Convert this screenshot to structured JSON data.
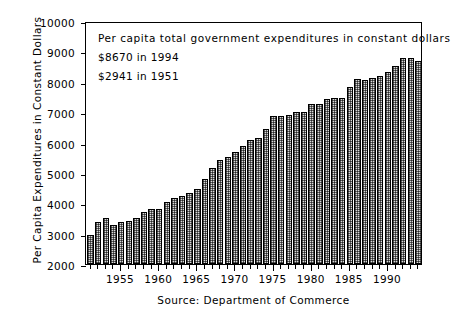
{
  "chart_data": {
    "type": "bar",
    "title": "",
    "xlabel": "",
    "ylabel": "Per Capita Expenditures in Constant Dollars",
    "ylim": [
      2000,
      10000
    ],
    "ytick_step": 1000,
    "yticks": [
      "10000",
      "9000",
      "8000",
      "7000",
      "6000",
      "5000",
      "4000",
      "3000",
      "2000"
    ],
    "xlim": [
      1950.4,
      1994.6
    ],
    "xticks": [
      1955,
      1960,
      1965,
      1970,
      1975,
      1980,
      1985,
      1990
    ],
    "xticklabels": [
      "1955",
      "1960",
      "1965",
      "1970",
      "1975",
      "1980",
      "1985",
      "1990"
    ],
    "grid": false,
    "legend": false,
    "categories": [
      1951,
      1952,
      1953,
      1954,
      1955,
      1956,
      1957,
      1958,
      1959,
      1960,
      1961,
      1962,
      1963,
      1964,
      1965,
      1966,
      1967,
      1968,
      1969,
      1970,
      1971,
      1972,
      1973,
      1974,
      1975,
      1976,
      1977,
      1978,
      1979,
      1980,
      1981,
      1982,
      1983,
      1984,
      1985,
      1986,
      1987,
      1988,
      1989,
      1990,
      1991,
      1992,
      1993,
      1994
    ],
    "values": [
      2941,
      3380,
      3500,
      3300,
      3370,
      3400,
      3520,
      3720,
      3800,
      3810,
      4030,
      4180,
      4250,
      4330,
      4480,
      4790,
      5160,
      5430,
      5520,
      5700,
      5900,
      6090,
      6150,
      6450,
      6870,
      6870,
      6900,
      7010,
      7010,
      7270,
      7280,
      7440,
      7470,
      7470,
      7840,
      8080,
      8060,
      8110,
      8200,
      8330,
      8530,
      8780,
      8780,
      8670
    ]
  },
  "annotation": {
    "line1": "Per capita total government expenditures in constant dollars",
    "line2": "$8670 in 1994",
    "line3": "$2941 in 1951"
  },
  "source": {
    "text": "Source: Department of Commerce"
  },
  "colors": {
    "axis": "#000000",
    "bar_fill": "#d9d9d9",
    "bar_edge": "#000000",
    "background": "#ffffff"
  }
}
